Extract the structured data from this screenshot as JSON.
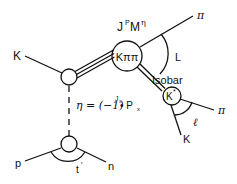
{
  "diagram": {
    "type": "Feynman-like scattering diagram (isobar model)",
    "labels": {
      "incoming_kaon": "K",
      "resonance_state": "J",
      "resonance_P": "P",
      "resonance_M": "M",
      "resonance_eta": "η",
      "central_system": "Kππ",
      "top_pion": "π",
      "angle_L": "L",
      "isobar_label": "Isobar",
      "isobar_state": "K",
      "isobar_star": "*",
      "right_pion": "π",
      "angle_l": "ℓ",
      "decay_kaon": "K",
      "exchange_eta": "η = (−1)",
      "exchange_exp": "J",
      "exchange_exp_sub": "x",
      "exchange_rest": "• P",
      "exchange_rest_sub": "x",
      "proton": "p",
      "neutron": "n",
      "momentum_transfer": "t",
      "momentum_transfer_prime": "′"
    },
    "nodes": [
      {
        "name": "production-vertex",
        "cx": 69,
        "cy": 77,
        "r": 8
      },
      {
        "name": "k-pi-pi-system",
        "cx": 127,
        "cy": 56,
        "r": 15
      },
      {
        "name": "k-star-isobar",
        "cx": 172,
        "cy": 96,
        "r": 9
      },
      {
        "name": "nucleon-vertex",
        "cx": 69,
        "cy": 144,
        "r": 8
      }
    ]
  },
  "colors": {
    "ink": "#111111",
    "background": "#ffffff"
  }
}
